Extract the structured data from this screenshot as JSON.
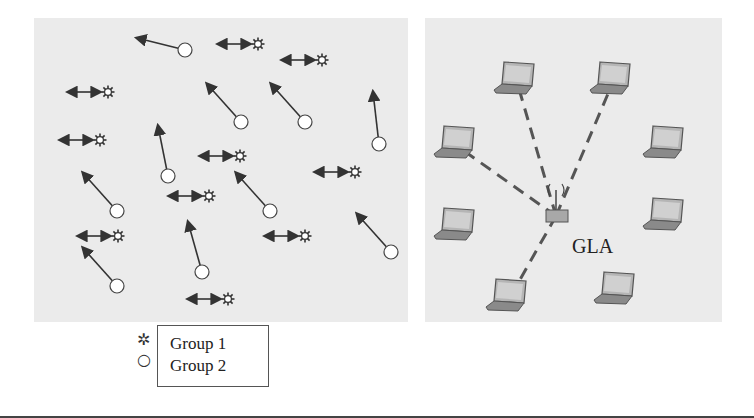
{
  "figure": {
    "left_panel": {
      "description": "Mobile nodes with movement arrows",
      "group1_nodes": [
        {
          "x": 258,
          "y": 44
        },
        {
          "x": 322,
          "y": 60
        },
        {
          "x": 108,
          "y": 92
        },
        {
          "x": 100,
          "y": 140
        },
        {
          "x": 240,
          "y": 156
        },
        {
          "x": 355,
          "y": 172
        },
        {
          "x": 209,
          "y": 196
        },
        {
          "x": 118,
          "y": 236
        },
        {
          "x": 305,
          "y": 236
        },
        {
          "x": 228,
          "y": 299
        }
      ],
      "group2_nodes": [
        {
          "x": 185,
          "y": 50,
          "dx": -48,
          "dy": -12
        },
        {
          "x": 241,
          "y": 122,
          "dx": -34,
          "dy": -38
        },
        {
          "x": 305,
          "y": 122,
          "dx": -34,
          "dy": -38
        },
        {
          "x": 379,
          "y": 144,
          "dx": -6,
          "dy": -52
        },
        {
          "x": 168,
          "y": 176,
          "dx": -10,
          "dy": -50
        },
        {
          "x": 117,
          "y": 211,
          "dx": -34,
          "dy": -38
        },
        {
          "x": 270,
          "y": 211,
          "dx": -34,
          "dy": -38
        },
        {
          "x": 391,
          "y": 252,
          "dx": -34,
          "dy": -38
        },
        {
          "x": 202,
          "y": 272,
          "dx": -14,
          "dy": -50
        },
        {
          "x": 117,
          "y": 286,
          "dx": -34,
          "dy": -38
        }
      ]
    },
    "right_panel": {
      "center_label": "GLA",
      "laptops": [
        {
          "x": 517,
          "y": 82,
          "linked": true
        },
        {
          "x": 613,
          "y": 82,
          "linked": true
        },
        {
          "x": 457,
          "y": 146,
          "linked": true
        },
        {
          "x": 666,
          "y": 146,
          "linked": false
        },
        {
          "x": 457,
          "y": 228,
          "linked": false
        },
        {
          "x": 666,
          "y": 218,
          "linked": false
        },
        {
          "x": 509,
          "y": 299,
          "linked": true
        },
        {
          "x": 617,
          "y": 292,
          "linked": false
        }
      ],
      "hub": {
        "x": 556,
        "y": 216
      }
    },
    "legend": {
      "items": [
        {
          "symbol": "star-icon",
          "label": "Group 1"
        },
        {
          "symbol": "circle-icon",
          "label": "Group 2"
        }
      ]
    }
  },
  "colors": {
    "panel_bg": "#ebebeb",
    "ink": "#333333",
    "laptop": "#8a8a8a"
  }
}
